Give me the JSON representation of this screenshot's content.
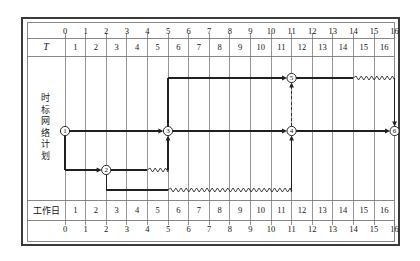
{
  "figure": {
    "title_vertical": "时标网络计划",
    "title_vertical_chars": [
      "时",
      "标",
      "网",
      "络",
      "计",
      "划"
    ],
    "row_label_T": "T",
    "row_label_workday": "工作日"
  },
  "axes": {
    "top_scale_label": "T",
    "top_tick_values": [
      "0",
      "1",
      "2",
      "3",
      "4",
      "5",
      "6",
      "7",
      "8",
      "9",
      "10",
      "11",
      "12",
      "13",
      "14",
      "15",
      "16"
    ],
    "top_cell_values": [
      "1",
      "2",
      "3",
      "4",
      "5",
      "6",
      "7",
      "8",
      "9",
      "10",
      "11",
      "12",
      "13",
      "14",
      "15",
      "16"
    ],
    "bottom_cell_values": [
      "1",
      "2",
      "3",
      "4",
      "5",
      "6",
      "7",
      "8",
      "9",
      "10",
      "11",
      "12",
      "13",
      "14",
      "15",
      "16"
    ],
    "bottom_tick_values": [
      "0",
      "1",
      "2",
      "3",
      "4",
      "5",
      "6",
      "7",
      "8",
      "9",
      "10",
      "11",
      "12",
      "13",
      "14",
      "15",
      "16"
    ]
  },
  "network": {
    "nodes": [
      {
        "id": "1",
        "label": "1",
        "day": 0,
        "lane": "middle"
      },
      {
        "id": "2",
        "label": "2",
        "day": 2,
        "lane": "lower"
      },
      {
        "id": "3",
        "label": "3",
        "day": 5,
        "lane": "middle"
      },
      {
        "id": "4",
        "label": "4",
        "day": 11,
        "lane": "middle"
      },
      {
        "id": "5",
        "label": "5",
        "day": 11,
        "lane": "upper"
      },
      {
        "id": "6",
        "label": "6",
        "day": 16,
        "lane": "middle"
      }
    ],
    "activities": [
      {
        "from": "1",
        "to": "3",
        "start_day": 0,
        "end_day": 5,
        "float_days": 0,
        "style": "solid"
      },
      {
        "from": "1",
        "to": "2",
        "start_day": 0,
        "end_day": 2,
        "float_days": 0,
        "style": "solid"
      },
      {
        "from": "2",
        "to": "3",
        "start_day": 2,
        "end_day": 4,
        "float_days": 1,
        "style": "solid-with-wave"
      },
      {
        "from": "2",
        "to": "4",
        "start_day": 2,
        "end_day": 5,
        "float_days": 6,
        "style": "solid-with-wave"
      },
      {
        "from": "3",
        "to": "5",
        "start_day": 5,
        "end_day": 11,
        "float_days": 0,
        "style": "solid"
      },
      {
        "from": "3",
        "to": "4",
        "start_day": 5,
        "end_day": 11,
        "float_days": 0,
        "style": "solid"
      },
      {
        "from": "5",
        "to": "6",
        "start_day": 11,
        "end_day": 14,
        "float_days": 2,
        "style": "solid-with-wave"
      },
      {
        "from": "4",
        "to": "6",
        "start_day": 11,
        "end_day": 16,
        "float_days": 0,
        "style": "solid"
      }
    ],
    "dummy_activities": [
      {
        "from": "4",
        "to": "5",
        "day": 11,
        "style": "dashed-vertical"
      }
    ]
  },
  "colors": {
    "frame": "#3a3a3a",
    "grid": "#6a6a6a",
    "arrow": "#202020",
    "text": "#141414",
    "background": "#ffffff"
  }
}
